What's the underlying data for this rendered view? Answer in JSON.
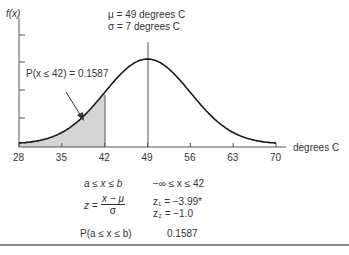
{
  "chart_data": {
    "type": "area",
    "xlabel": "degrees C",
    "ylabel": "f(x)",
    "x_ticks": [
      28,
      35,
      42,
      49,
      56,
      63,
      70
    ],
    "xlim": [
      28,
      70
    ],
    "y_ticks_count": 4,
    "mean": 49,
    "std_dev": 7,
    "shaded_region": {
      "from": 28,
      "to": 42,
      "probability": 0.1587
    },
    "annotations": [
      "μ = 49 degrees C",
      "σ = 7 degrees C",
      "P(x ≤ 42) = 0.1587"
    ],
    "grid": false,
    "legend": "none"
  },
  "labels": {
    "fx": "f(x)",
    "mu": "μ = 49 degrees C",
    "sigma": "σ = 7 degrees C",
    "prob_annotation": "P(x ≤ 42) = 0.1587",
    "xaxis_label": "degrees C",
    "ticks": [
      "28",
      "35",
      "42",
      "49",
      "56",
      "63",
      "70"
    ]
  },
  "formula_table": {
    "row1_left": "a ≤ x ≤ b",
    "row1_right": "−∞ ≤ x ≤ 42",
    "z_lhs": "z =",
    "z_num": "x − μ",
    "z_den": "σ",
    "z1": "z₁ = −3.99*",
    "z2": "z₂ = −1.0",
    "row3_left": "P(a ≤ x ≤ b)",
    "row3_right": "0.1587"
  },
  "colors": {
    "curve": "#1a1a1a",
    "shade": "#d4d4d4",
    "axis": "#555555"
  }
}
